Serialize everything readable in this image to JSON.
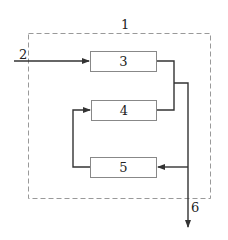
{
  "diagram": {
    "boundary_label": "1",
    "input_label": "2",
    "output_label": "6",
    "blocks": [
      {
        "id": "3",
        "label": "3"
      },
      {
        "id": "4",
        "label": "4"
      },
      {
        "id": "5",
        "label": "5"
      }
    ],
    "colors": {
      "line": "#333333",
      "box_border": "#888888",
      "dashed_border": "#999999"
    }
  }
}
